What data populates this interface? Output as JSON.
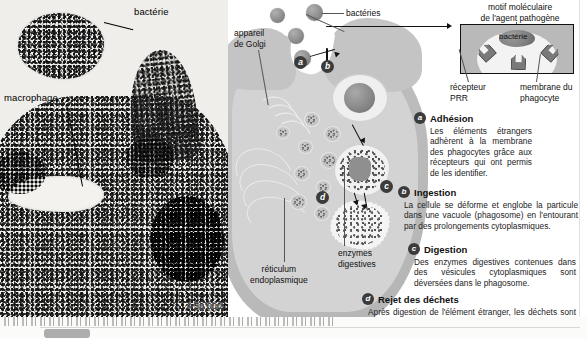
{
  "photo": {
    "label_bacteria": "bactérie",
    "label_macrophage": "macrophage",
    "magnification": "× 50 000"
  },
  "schema": {
    "label_bacteria": "bactéries",
    "label_golgi": "appareil\nde Golgi",
    "label_golgi_line1": "appareil",
    "label_golgi_line2": "de Golgi",
    "label_er_line1": "réticulum",
    "label_er_line2": "endoplasmique",
    "label_enzymes_line1": "enzymes",
    "label_enzymes_line2": "digestives",
    "markers": [
      "a",
      "b",
      "c",
      "d"
    ]
  },
  "inset": {
    "title_line1": "motif moléculaire",
    "title_line2": "de l'agent pathogène",
    "bacteria_label": "bactérie",
    "receptor_line1": "récepteur",
    "receptor_line2": "PRR",
    "membrane_line1": "membrane du",
    "membrane_line2": "phagocyte"
  },
  "steps": [
    {
      "marker": "a",
      "title": "Adhésion",
      "body": "Les éléments étrangers adhèrent à la membrane des phagocytes grâce aux récepteurs qui ont permis de les identifier."
    },
    {
      "marker": "b",
      "title": "Ingestion",
      "body": "La cellule se déforme et englobe la particule dans une vacuole (phagosome) en l'entourant par des prolongements cytoplasmiques."
    },
    {
      "marker": "c",
      "title": "Digestion",
      "body": "Des enzymes digestives contenues dans des vésicules cytoplasmiques sont déversées dans le phagosome."
    },
    {
      "marker": "d",
      "title": "Rejet des déchets",
      "body": "Après digestion de l'élément étranger, les déchets sont rejetés à l'extérieur du phagocyte."
    }
  ],
  "colors": {
    "cell_fill": "#c9c9c9",
    "cell_inner": "#d3d3d3",
    "bacteria": "#8e8e8e",
    "marker_bg": "#3b3b3b",
    "inset_membrane": "#b9b9b9",
    "text": "#1b1b1b"
  }
}
